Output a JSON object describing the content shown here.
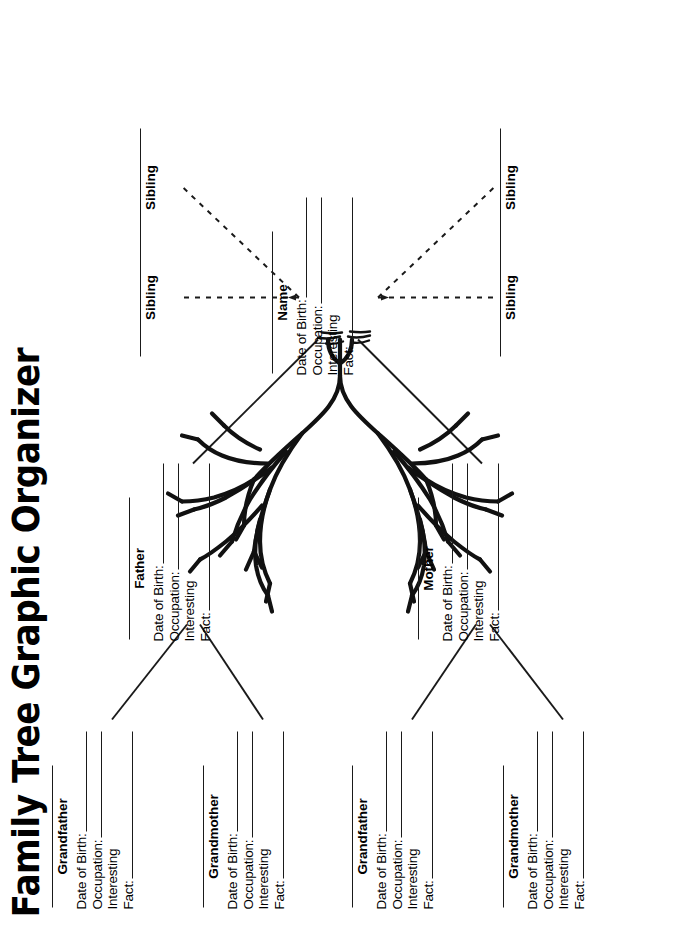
{
  "title": "Family Tree Graphic Organizer",
  "fields": {
    "date_of_birth": "Date of Birth:",
    "occupation": "Occupation:",
    "interesting": "Interesting",
    "fact": "Fact:"
  },
  "people": [
    {
      "id": "paternal-grandfather",
      "role": "Grandfather"
    },
    {
      "id": "paternal-grandmother",
      "role": "Grandmother"
    },
    {
      "id": "maternal-grandfather",
      "role": "Grandfather"
    },
    {
      "id": "maternal-grandmother",
      "role": "Grandmother"
    },
    {
      "id": "father",
      "role": "Father"
    },
    {
      "id": "mother",
      "role": "Mother"
    },
    {
      "id": "self",
      "role": "Name"
    }
  ],
  "siblings": [
    {
      "id": "sibling-1",
      "label": "Sibling"
    },
    {
      "id": "sibling-2",
      "label": "Sibling"
    },
    {
      "id": "sibling-3",
      "label": "Sibling"
    },
    {
      "id": "sibling-4",
      "label": "Sibling"
    }
  ],
  "graphic": {
    "center_image": "family-tree-line-art",
    "description": "Hand-drawn outline of a leafy tree with grass at the base"
  },
  "colors": {
    "ink": "#1a1a1a",
    "paper": "#ffffff"
  }
}
